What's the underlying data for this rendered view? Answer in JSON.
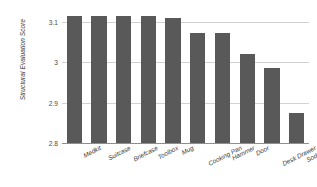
{
  "chart_data": {
    "type": "bar",
    "title": "",
    "xlabel": "",
    "ylabel": "Structural Evaluation Score",
    "categories": [
      "Medkit",
      "Suitcase",
      "Briefcase",
      "Toolbox",
      "Mug",
      "Cooking Pan",
      "Hammer",
      "Door",
      "Desk Drawer",
      "Soda Can"
    ],
    "values": [
      3.115,
      3.114,
      3.114,
      3.114,
      3.11,
      3.073,
      3.073,
      3.022,
      2.987,
      2.875
    ],
    "ylim": [
      2.8,
      3.14
    ],
    "yticks": [
      2.8,
      2.9,
      3.0,
      3.1
    ],
    "ytick_labels": [
      "2.8",
      "2.9",
      "3",
      "3.1"
    ],
    "grid": true,
    "legend": false,
    "bar_color": "#595959",
    "gridline_color": "#d2d2d2",
    "axis_color": "#8f8f8f",
    "background_color": "#ffffff"
  }
}
